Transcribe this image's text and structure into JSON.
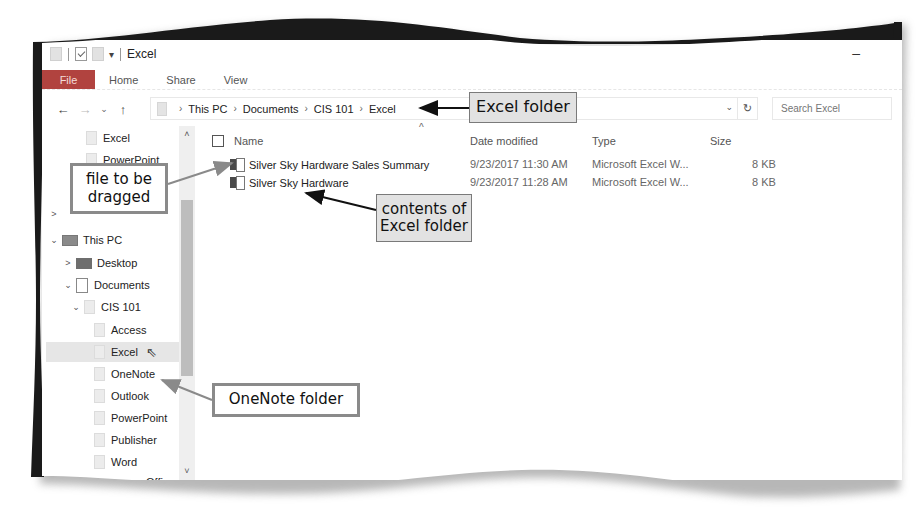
{
  "window": {
    "title": "Excel",
    "quick_access": [
      "properties-icon",
      "new-folder-icon",
      "folder-icon",
      "customize-dropdown"
    ],
    "minimize_label": "–"
  },
  "ribbon": {
    "tabs": [
      {
        "label": "File",
        "active": true
      },
      {
        "label": "Home"
      },
      {
        "label": "Share"
      },
      {
        "label": "View"
      }
    ],
    "file_color": "#b1433f"
  },
  "navigation": {
    "back": "←",
    "forward": "→",
    "recent": "⌄",
    "up": "↑"
  },
  "address_bar": {
    "breadcrumbs": [
      "This PC",
      "Documents",
      "CIS 101",
      "Excel"
    ],
    "dropdown": "⌄",
    "refresh": "↻"
  },
  "search": {
    "placeholder": "Search Excel"
  },
  "nav_pane": {
    "items": [
      {
        "label": "Excel",
        "level": 1,
        "icon": "folder"
      },
      {
        "label": "PowerPoint",
        "level": 1,
        "icon": "folder"
      },
      {
        "label": "",
        "level": 0,
        "icon": "folder",
        "chevron": ">"
      },
      {
        "label": "This PC",
        "level": 0,
        "icon": "pc",
        "chevron": "⌄"
      },
      {
        "label": "Desktop",
        "level": 1,
        "icon": "desktop",
        "chevron": ">"
      },
      {
        "label": "Documents",
        "level": 1,
        "icon": "documents",
        "chevron": "⌄"
      },
      {
        "label": "CIS 101",
        "level": 2,
        "icon": "folder",
        "chevron": "⌄"
      },
      {
        "label": "Access",
        "level": 3,
        "icon": "folder"
      },
      {
        "label": "Excel",
        "level": 3,
        "icon": "folder",
        "selected": true
      },
      {
        "label": "OneNote",
        "level": 3,
        "icon": "folder"
      },
      {
        "label": "Outlook",
        "level": 3,
        "icon": "folder"
      },
      {
        "label": "PowerPoint",
        "level": 3,
        "icon": "folder"
      },
      {
        "label": "Publisher",
        "level": 3,
        "icon": "folder"
      },
      {
        "label": "Word",
        "level": 3,
        "icon": "folder"
      },
      {
        "label": "Office",
        "level": 2,
        "icon": "folder"
      }
    ],
    "scroll_up": "˄",
    "scroll_down": "˅"
  },
  "file_list": {
    "sort_indicator": "^",
    "columns": [
      "Name",
      "Date modified",
      "Type",
      "Size"
    ],
    "rows": [
      {
        "name": "Silver Sky Hardware Sales Summary",
        "date": "9/23/2017 11:30 AM",
        "type": "Microsoft Excel W...",
        "size": "8 KB"
      },
      {
        "name": "Silver Sky Hardware",
        "date": "9/23/2017 11:28 AM",
        "type": "Microsoft Excel W...",
        "size": "8 KB"
      }
    ]
  },
  "callouts": {
    "excel_folder": "Excel folder",
    "file_to_be_dragged_1": "file to be",
    "file_to_be_dragged_2": "dragged",
    "contents_1": "contents of",
    "contents_2": "Excel folder",
    "onenote_folder": "OneNote folder"
  }
}
